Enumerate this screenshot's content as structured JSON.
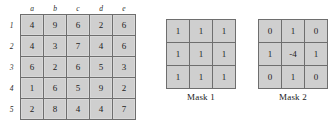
{
  "figure": {
    "image_matrix": {
      "name": "image-matrix",
      "column_headers": [
        "a",
        "b",
        "c",
        "d",
        "e"
      ],
      "row_headers": [
        "1",
        "2",
        "3",
        "4",
        "5"
      ],
      "rows": [
        [
          "4",
          "9",
          "6",
          "2",
          "6"
        ],
        [
          "4",
          "3",
          "7",
          "4",
          "6"
        ],
        [
          "6",
          "2",
          "6",
          "5",
          "3"
        ],
        [
          "1",
          "6",
          "5",
          "9",
          "2"
        ],
        [
          "2",
          "8",
          "4",
          "4",
          "7"
        ]
      ]
    },
    "masks": [
      {
        "caption": "Mask 1",
        "rows": [
          [
            "1",
            "1",
            "1"
          ],
          [
            "1",
            "1",
            "1"
          ],
          [
            "1",
            "1",
            "1"
          ]
        ]
      },
      {
        "caption": "Mask 2",
        "rows": [
          [
            "0",
            "1",
            "0"
          ],
          [
            "1",
            "-4",
            "1"
          ],
          [
            "0",
            "1",
            "0"
          ]
        ]
      }
    ]
  },
  "colors": {
    "cell_fill": "#cfcfcf",
    "cell_border": "#6e6e6e",
    "background": "#ffffff",
    "text": "#232323"
  }
}
